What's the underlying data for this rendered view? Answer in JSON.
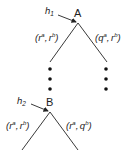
{
  "tree": {
    "node_a": {
      "label": "A",
      "info_set": "h",
      "info_set_sub": "1"
    },
    "node_b": {
      "label": "B",
      "info_set": "h",
      "info_set_sub": "2"
    },
    "edges_a": {
      "left": {
        "open": "(",
        "r1": "r",
        "s1": "a",
        "sep": ",",
        "r2": "r",
        "s2": "b",
        "close": ")"
      },
      "right": {
        "open": "(",
        "r1": "q",
        "s1": "a",
        "sep": ",",
        "r2": "r",
        "s2": "b",
        "close": ")"
      }
    },
    "edges_b": {
      "left": {
        "open": "(",
        "r1": "r",
        "s1": "a",
        "sep": ",",
        "r2": "r",
        "s2": "b",
        "close": ")"
      },
      "right": {
        "open": "(",
        "r1": "r",
        "s1": "a",
        "sep": ",",
        "r2": "q",
        "s2": "b",
        "close": ")"
      }
    },
    "colors": {
      "ink": "#222222",
      "background": "#ffffff"
    }
  }
}
